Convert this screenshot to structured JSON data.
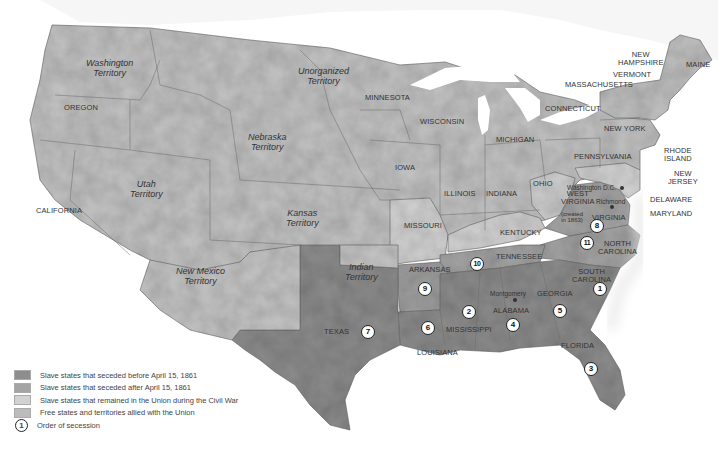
{
  "map": {
    "colors": {
      "seceded_before": "#8d8d8d",
      "seceded_after": "#a4a4a4",
      "slave_union": "#d2d2d2",
      "free_union": "#bcbcbc",
      "water": "#ffffff",
      "border": "#6a6a6a"
    },
    "states": {
      "maine": "MAINE",
      "new_hampshire": "NEW\nHAMPSHIRE",
      "vermont": "VERMONT",
      "massachusetts": "MASSACHUSETTS",
      "connecticut": "CONNECTICUT",
      "new_york": "NEW YORK",
      "rhode_island": "RHODE\nISLAND",
      "new_jersey": "NEW\nJERSEY",
      "delaware": "DELAWARE",
      "maryland": "MARYLAND",
      "pennsylvania": "PENNSYLVANIA",
      "ohio": "OHIO",
      "michigan": "MICHIGAN",
      "indiana": "INDIANA",
      "illinois": "ILLINOIS",
      "wisconsin": "WISCONSIN",
      "minnesota": "MINNESOTA",
      "iowa": "IOWA",
      "missouri": "MISSOURI",
      "kentucky": "KENTUCKY",
      "west_virginia": "WEST\nVIRGINIA",
      "west_virginia_note": "(created\nin 1863)",
      "virginia": "VIRGINIA",
      "north_carolina": "NORTH\nCAROLINA",
      "south_carolina": "SOUTH\nCAROLINA",
      "tennessee": "TENNESSEE",
      "arkansas": "ARKANSAS",
      "georgia": "GEORGIA",
      "alabama": "ALABAMA",
      "mississippi": "MISSISSIPPI",
      "louisiana": "LOUISIANA",
      "florida": "FLORIDA",
      "texas": "TEXAS",
      "oregon": "OREGON",
      "california": "CALIFORNIA"
    },
    "territories": {
      "washington": "Washington\nTerritory",
      "unorganized": "Unorganized\nTerritory",
      "nebraska": "Nebraska\nTerritory",
      "utah": "Utah\nTerritory",
      "kansas": "Kansas\nTerritory",
      "new_mexico": "New Mexico\nTerritory",
      "indian": "Indian\nTerritory"
    },
    "cities": {
      "washington_dc": "Washington D.C.",
      "richmond": "Richmond",
      "montgomery": "Montgomery"
    },
    "secession_order": {
      "south_carolina": "1",
      "mississippi": "2",
      "florida": "3",
      "alabama": "4",
      "georgia": "5",
      "louisiana": "6",
      "texas": "7",
      "virginia": "8",
      "arkansas": "9",
      "tennessee": "10",
      "north_carolina": "11"
    }
  },
  "legend": {
    "items": [
      {
        "label": "Slave states that seceded before April 15, 1861",
        "color": "#8d8d8d"
      },
      {
        "label": "Slave states that seceded after April 15, 1861",
        "color": "#a4a4a4"
      },
      {
        "label": "Slave states that remained in the Union during the Civil War",
        "color": "#d2d2d2"
      },
      {
        "label": "Free states and territories allied with the Union",
        "color": "#bcbcbc"
      }
    ],
    "order_symbol": "1",
    "order_label": "Order of secession"
  }
}
